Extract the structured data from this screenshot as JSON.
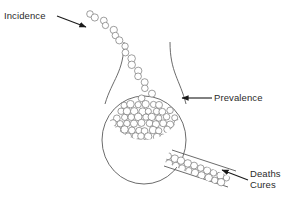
{
  "figure": {
    "type": "conceptual-diagram",
    "background_color": "#ffffff",
    "stroke_color": "#5a5a5a",
    "text_color": "#2b2b2b",
    "arrow_color": "#1a1a1a"
  },
  "labels": {
    "incidence": "Incidence",
    "prevalence": "Prevalence",
    "deaths": "Deaths",
    "cures": "Cures"
  },
  "chart_data": {
    "type": "diagram",
    "title": "",
    "nodes": [
      {
        "id": "incidence",
        "label": "Incidence",
        "role": "inflow",
        "position": "top-left"
      },
      {
        "id": "prevalence",
        "label": "Prevalence",
        "role": "pool",
        "position": "center-bulb"
      },
      {
        "id": "deaths",
        "label": "Deaths",
        "role": "outflow",
        "position": "bottom-right"
      },
      {
        "id": "cures",
        "label": "Cures",
        "role": "outflow",
        "position": "bottom-right"
      }
    ],
    "edges": [
      {
        "from": "incidence",
        "to": "prevalence",
        "style": "arrow"
      },
      {
        "from": "prevalence",
        "to": "deaths",
        "style": "arrow"
      },
      {
        "from": "prevalence",
        "to": "cures",
        "style": "arrow"
      }
    ],
    "annotations": [
      "Incidence",
      "Prevalence",
      "Deaths",
      "Cures"
    ],
    "legend": [],
    "grid": false
  },
  "geometry": {
    "bulb": {
      "cx": 144,
      "cy": 140,
      "rx": 42,
      "ry": 44
    },
    "neck_top_y": 42,
    "inflow_chain_start": [
      90,
      14
    ],
    "inflow_chain_end": [
      152,
      96
    ],
    "outflow_angle_deg": 20,
    "circle_diameter_px": 7
  }
}
